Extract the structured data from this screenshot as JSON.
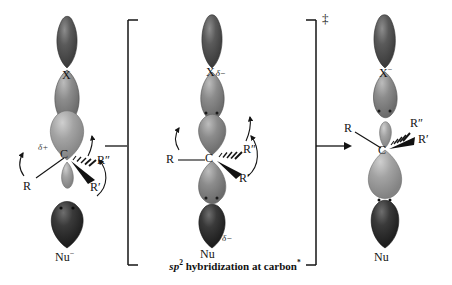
{
  "figure": {
    "type": "reaction-mechanism-diagram",
    "caption": {
      "prefix": "sp",
      "superscript": "2",
      "text": " hybridization at carbon",
      "footnote_marker": "*"
    },
    "transition_state_marker": "‡",
    "colors": {
      "lobe_dark": "#4a4a4a",
      "lobe_mid": "#7d7d7d",
      "lobe_light": "#9a9a9a",
      "lobe_darkest": "#2e2e2e",
      "ink": "#141414",
      "background": "#ffffff"
    }
  },
  "stages": [
    {
      "id": "reactants",
      "name": "reactants",
      "labels": {
        "leaving_group": "X",
        "leaving_group_charge": "",
        "carbon": "C",
        "carbon_charge": "δ+",
        "substituent_plain": "R",
        "substituent_hash": "R″",
        "substituent_wedge": "R′",
        "nucleophile": "Nu",
        "nucleophile_charge": "−"
      },
      "curved_arrows": 3
    },
    {
      "id": "transition-state",
      "name": "transition state",
      "labels": {
        "leaving_group": "X",
        "leaving_group_charge": "δ−",
        "carbon": "C",
        "carbon_charge": "",
        "substituent_plain": "R",
        "substituent_hash": "R″",
        "substituent_wedge": "R′",
        "nucleophile": "Nu",
        "nucleophile_charge": "δ−"
      },
      "curved_arrows": 3
    },
    {
      "id": "products",
      "name": "products",
      "labels": {
        "leaving_group": "X",
        "leaving_group_charge": "−",
        "carbon": "C",
        "carbon_charge": "",
        "substituent_plain": "R",
        "substituent_hash": "R″",
        "substituent_wedge": "R′",
        "nucleophile": "Nu",
        "nucleophile_charge": ""
      },
      "curved_arrows": 0
    }
  ],
  "connectors": {
    "left_bracket": "[",
    "right_bracket": "]",
    "reaction_arrow": "→",
    "pre_bracket_bond": "—"
  }
}
